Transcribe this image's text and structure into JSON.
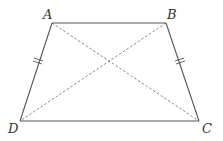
{
  "diagram": {
    "type": "isosceles trapezoid with diagonals",
    "vertices": [
      {
        "label": "A",
        "x": 52,
        "y": 23,
        "label_x": 43,
        "label_y": 19
      },
      {
        "label": "B",
        "x": 166,
        "y": 23,
        "label_x": 167,
        "label_y": 19
      },
      {
        "label": "C",
        "x": 199,
        "y": 121,
        "label_x": 202,
        "label_y": 133
      },
      {
        "label": "D",
        "x": 20,
        "y": 121,
        "label_x": 8,
        "label_y": 133
      }
    ],
    "edges": [
      {
        "from": "A",
        "to": "B",
        "style": "solid"
      },
      {
        "from": "B",
        "to": "C",
        "style": "solid",
        "tick_marks": 2
      },
      {
        "from": "C",
        "to": "D",
        "style": "solid"
      },
      {
        "from": "D",
        "to": "A",
        "style": "solid",
        "tick_marks": 2
      }
    ],
    "diagonals": [
      {
        "from": "A",
        "to": "C",
        "style": "dashed"
      },
      {
        "from": "B",
        "to": "D",
        "style": "dashed"
      }
    ],
    "colors": {
      "stroke": "#555555",
      "dashed": "#777777",
      "label": "#333333"
    }
  }
}
